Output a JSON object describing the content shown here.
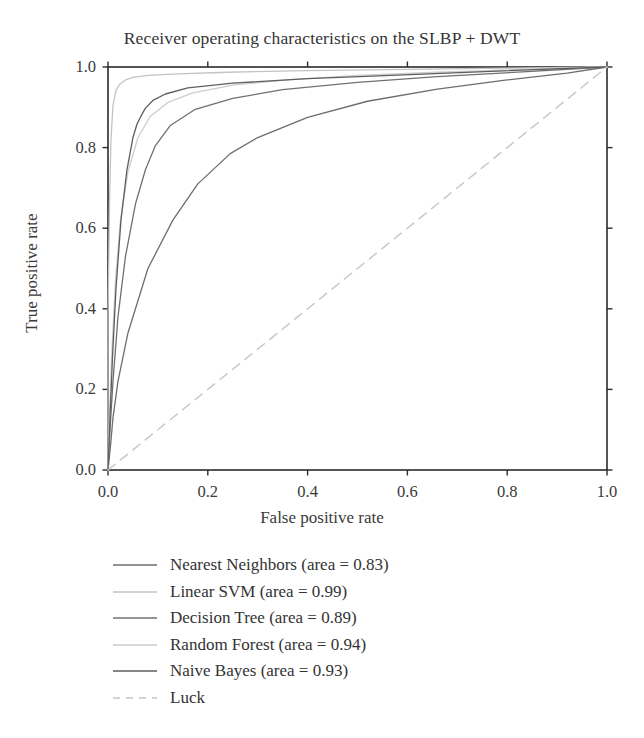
{
  "chart_data": {
    "type": "line",
    "title": "Receiver operating characteristics on the SLBP + DWT",
    "xlabel": "False positive rate",
    "ylabel": "True positive rate",
    "xlim": [
      0.0,
      1.0
    ],
    "ylim": [
      0.0,
      1.0
    ],
    "xticks": [
      "0.0",
      "0.2",
      "0.4",
      "0.6",
      "0.8",
      "1.0"
    ],
    "yticks": [
      "0.0",
      "0.2",
      "0.4",
      "0.6",
      "0.8",
      "1.0"
    ],
    "grid": false,
    "legend_position": "below-axes",
    "series": [
      {
        "name": "Nearest Neighbors",
        "area": 0.83,
        "legend_label": "Nearest Neighbors (area = 0.83)",
        "color": "#6d6d6d",
        "linestyle": "solid",
        "x": [
          0.0,
          0.005,
          0.01,
          0.02,
          0.04,
          0.08,
          0.13,
          0.18,
          0.245,
          0.3,
          0.4,
          0.52,
          0.66,
          0.8,
          0.92,
          1.0
        ],
        "y": [
          0.0,
          0.06,
          0.13,
          0.22,
          0.34,
          0.5,
          0.62,
          0.71,
          0.785,
          0.825,
          0.875,
          0.915,
          0.945,
          0.968,
          0.985,
          1.0
        ]
      },
      {
        "name": "Linear SVM",
        "area": 0.99,
        "legend_label": "Linear SVM (area = 0.99)",
        "color": "#c3c3c3",
        "linestyle": "solid",
        "x": [
          0.0,
          0.0,
          0.003,
          0.006,
          0.01,
          0.016,
          0.024,
          0.035,
          0.05,
          0.08,
          0.14,
          0.24,
          0.4,
          0.6,
          0.8,
          1.0
        ],
        "y": [
          0.0,
          0.375,
          0.66,
          0.82,
          0.905,
          0.942,
          0.958,
          0.968,
          0.974,
          0.979,
          0.983,
          0.987,
          0.991,
          0.994,
          0.997,
          1.0
        ]
      },
      {
        "name": "Decision Tree",
        "area": 0.89,
        "legend_label": "Decision Tree (area = 0.89)",
        "color": "#707070",
        "linestyle": "solid",
        "x": [
          0.0,
          0.004,
          0.01,
          0.02,
          0.035,
          0.055,
          0.075,
          0.095,
          0.125,
          0.175,
          0.25,
          0.35,
          0.5,
          0.66,
          0.83,
          1.0
        ],
        "y": [
          0.0,
          0.1,
          0.22,
          0.38,
          0.53,
          0.66,
          0.745,
          0.805,
          0.855,
          0.895,
          0.922,
          0.944,
          0.962,
          0.976,
          0.988,
          1.0
        ]
      },
      {
        "name": "Random Forest",
        "area": 0.94,
        "legend_label": "Random Forest (area = 0.94)",
        "color": "#cdcdcd",
        "linestyle": "solid",
        "x": [
          0.0,
          0.003,
          0.008,
          0.015,
          0.025,
          0.04,
          0.06,
          0.085,
          0.12,
          0.17,
          0.25,
          0.36,
          0.5,
          0.66,
          0.83,
          1.0
        ],
        "y": [
          0.0,
          0.14,
          0.3,
          0.47,
          0.62,
          0.74,
          0.825,
          0.878,
          0.912,
          0.936,
          0.955,
          0.968,
          0.979,
          0.987,
          0.994,
          1.0
        ]
      },
      {
        "name": "Naive Bayes",
        "area": 0.93,
        "legend_label": "Naive Bayes (area = 0.93)",
        "color": "#5e5e5e",
        "linestyle": "solid",
        "x": [
          0.0,
          0.004,
          0.009,
          0.016,
          0.026,
          0.038,
          0.05,
          0.058,
          0.066,
          0.075,
          0.09,
          0.115,
          0.16,
          0.25,
          0.4,
          0.58,
          0.78,
          1.0
        ],
        "y": [
          0.0,
          0.13,
          0.28,
          0.45,
          0.62,
          0.745,
          0.825,
          0.858,
          0.878,
          0.898,
          0.917,
          0.933,
          0.948,
          0.96,
          0.971,
          0.98,
          0.99,
          1.0
        ]
      },
      {
        "name": "Luck",
        "legend_label": "Luck",
        "color": "#c8c8c8",
        "linestyle": "dashed",
        "x": [
          0.0,
          1.0
        ],
        "y": [
          0.0,
          1.0
        ]
      }
    ]
  }
}
